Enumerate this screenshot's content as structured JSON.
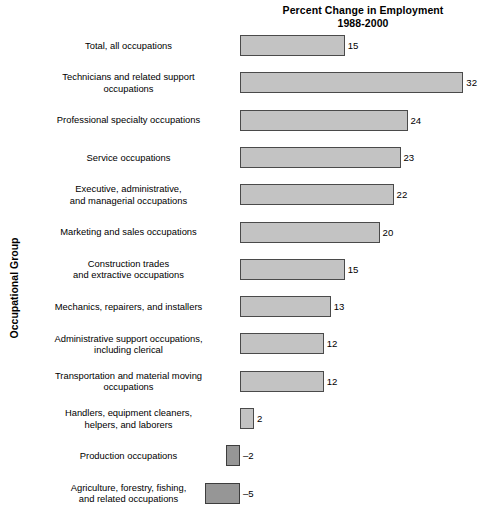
{
  "chart_data": {
    "type": "bar",
    "orientation": "horizontal",
    "title": "Percent Change in Employment",
    "subtitle": "1988-2000",
    "xlabel": "",
    "ylabel": "Occupational Group",
    "grid": false,
    "legend": "none",
    "xlim": [
      -5,
      32
    ],
    "zero_baseline": 0,
    "categories": [
      "Total, all occupations",
      "Technicians and related support occupations",
      "Professional specialty occupations",
      "Service occupations",
      "Executive, administrative, and managerial occupations",
      "Marketing and sales occupations",
      "Construction trades and extractive occupations",
      "Mechanics, repairers, and installers",
      "Administrative support occupations, including clerical",
      "Transportation and material moving occupations",
      "Handlers, equipment cleaners, helpers, and laborers",
      "Production occupations",
      "Agriculture, forestry, fishing, and related occupations"
    ],
    "values": [
      15,
      32,
      24,
      23,
      22,
      20,
      15,
      13,
      12,
      12,
      2,
      -2,
      -5
    ],
    "value_labels": [
      "15",
      "32",
      "24",
      "23",
      "22",
      "20",
      "15",
      "13",
      "12",
      "12",
      "2",
      "–2",
      "–5"
    ],
    "colors": {
      "positive_fill": "#c3c3c3",
      "negative_fill": "#969696",
      "bar_border": "#4a4a4a",
      "background": "#ffffff",
      "text": "#000000"
    }
  },
  "chart": {
    "title_line1": "Percent Change in Employment",
    "title_line2": "1988-2000",
    "y_axis_title": "Occupational Group",
    "rows": [
      {
        "label_line1": "Total, all occupations",
        "label_line2": "",
        "value_label": "15"
      },
      {
        "label_line1": "Technicians and related support",
        "label_line2": "occupations",
        "value_label": "32"
      },
      {
        "label_line1": "Professional specialty occupations",
        "label_line2": "",
        "value_label": "24"
      },
      {
        "label_line1": "Service occupations",
        "label_line2": "",
        "value_label": "23"
      },
      {
        "label_line1": "Executive, administrative,",
        "label_line2": "and managerial occupations",
        "value_label": "22"
      },
      {
        "label_line1": "Marketing and sales occupations",
        "label_line2": "",
        "value_label": "20"
      },
      {
        "label_line1": "Construction trades",
        "label_line2": "and extractive occupations",
        "value_label": "15"
      },
      {
        "label_line1": "Mechanics, repairers, and installers",
        "label_line2": "",
        "value_label": "13"
      },
      {
        "label_line1": "Administrative support occupations,",
        "label_line2": "including clerical",
        "value_label": "12"
      },
      {
        "label_line1": "Transportation and material moving",
        "label_line2": "occupations",
        "value_label": "12"
      },
      {
        "label_line1": "Handlers, equipment cleaners,",
        "label_line2": "helpers, and laborers",
        "value_label": "2"
      },
      {
        "label_line1": "Production occupations",
        "label_line2": "",
        "value_label": "–2"
      },
      {
        "label_line1": "Agriculture, forestry, fishing,",
        "label_line2": "and related occupations",
        "value_label": "–5"
      }
    ]
  }
}
